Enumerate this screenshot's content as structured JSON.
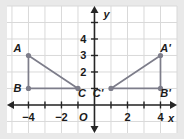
{
  "figure": {
    "background_color": "#e9e9e9",
    "plot_background_color": "#ffffff",
    "grid_color": "#d9d9d9",
    "axis_color": "#262626",
    "shape_color": "#7d7d8a",
    "label_color": "#1a1a1a"
  },
  "axes": {
    "x_label": "x",
    "y_label": "y",
    "origin_label": "O",
    "x_ticks": [
      {
        "value": -4,
        "label": "-4"
      },
      {
        "value": -3,
        "label": ""
      },
      {
        "value": -2,
        "label": "-2"
      },
      {
        "value": -1,
        "label": ""
      },
      {
        "value": 1,
        "label": ""
      },
      {
        "value": 2,
        "label": "2"
      },
      {
        "value": 3,
        "label": ""
      },
      {
        "value": 4,
        "label": "4"
      }
    ],
    "y_ticks": [
      {
        "value": 1,
        "label": ""
      },
      {
        "value": 2,
        "label": "2"
      },
      {
        "value": 3,
        "label": "3"
      },
      {
        "value": 4,
        "label": "4"
      },
      {
        "value": 5,
        "label": ""
      }
    ],
    "xlim": [
      -5.3,
      5.0
    ],
    "ylim": [
      -1.7,
      6.0
    ],
    "grid": true
  },
  "chart_data": {
    "type": "scatter",
    "xlabel": "x",
    "ylabel": "y",
    "xlim": [
      -5.3,
      5.0
    ],
    "ylim": [
      -1.7,
      6.0
    ],
    "grid": true,
    "series": [
      {
        "name": "Triangle ABC",
        "closed": true,
        "points": [
          {
            "label": "A",
            "x": -4,
            "y": 3,
            "label_dx": -11,
            "label_dy": -3
          },
          {
            "label": "B",
            "x": -4,
            "y": 1,
            "label_dx": -11,
            "label_dy": 4
          },
          {
            "label": "C",
            "x": -1,
            "y": 1,
            "label_dx": 4,
            "label_dy": 9
          }
        ]
      },
      {
        "name": "Triangle A'B'C'",
        "closed": true,
        "points": [
          {
            "label": "A'",
            "x": 4,
            "y": 3,
            "label_dx": 5,
            "label_dy": -3
          },
          {
            "label": "B'",
            "x": 4,
            "y": 1,
            "label_dx": 5,
            "label_dy": 9
          },
          {
            "label": "C'",
            "x": 1,
            "y": 1,
            "label_dx": -13,
            "label_dy": 9
          }
        ]
      }
    ]
  }
}
